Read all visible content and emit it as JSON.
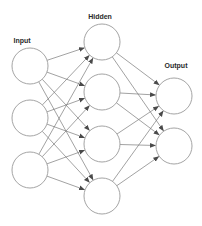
{
  "diagram": {
    "title": "",
    "type": "feedforward-neural-network",
    "colors": {
      "background": "#ffffff",
      "node_stroke": "#9a9a9a",
      "edge": "#7a7a7a",
      "arrowhead": "#4a4a4a",
      "label": "#2a2a2a"
    },
    "node_radius": 18,
    "layers": [
      {
        "id": "input",
        "label": "Input",
        "label_pos": [
          22,
          43
        ],
        "nodes": [
          {
            "id": "i1",
            "cx": 30,
            "cy": 66
          },
          {
            "id": "i2",
            "cx": 30,
            "cy": 118
          },
          {
            "id": "i3",
            "cx": 30,
            "cy": 170
          }
        ]
      },
      {
        "id": "hidden",
        "label": "Hidden",
        "label_pos": [
          100,
          19
        ],
        "nodes": [
          {
            "id": "h1",
            "cx": 102,
            "cy": 42
          },
          {
            "id": "h2",
            "cx": 102,
            "cy": 92
          },
          {
            "id": "h3",
            "cx": 102,
            "cy": 144
          },
          {
            "id": "h4",
            "cx": 102,
            "cy": 196
          }
        ]
      },
      {
        "id": "output",
        "label": "Output",
        "label_pos": [
          176,
          68
        ],
        "nodes": [
          {
            "id": "o1",
            "cx": 174,
            "cy": 96
          },
          {
            "id": "o2",
            "cx": 174,
            "cy": 146
          }
        ]
      }
    ],
    "connections": "fully-connected between consecutive layers (3→4→2), arrows pointing left to right"
  }
}
